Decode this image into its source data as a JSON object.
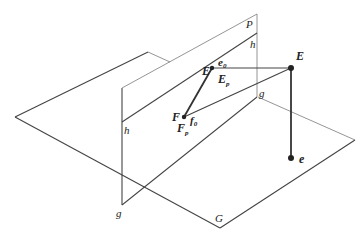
{
  "diagram": {
    "type": "3d-projection-geometry",
    "planes": {
      "ground": {
        "label": "G"
      },
      "picture": {
        "label": "P"
      }
    },
    "labels": {
      "P": "P",
      "G": "G",
      "h_right": "h",
      "h_left": "h",
      "g_right": "g",
      "g_bottom": "g",
      "E_eye": "E",
      "E_proj": "E",
      "e0": "e",
      "e0_sub": "0",
      "Ep": "E",
      "Ep_sub": "p",
      "F": "F",
      "f0": "f",
      "f0_sub": "0",
      "Fp": "F",
      "Fp_sub": "p",
      "e_foot": "e"
    },
    "colors": {
      "line": "#444444",
      "thin_line": "#7a7a7a",
      "point": "#222222"
    }
  }
}
